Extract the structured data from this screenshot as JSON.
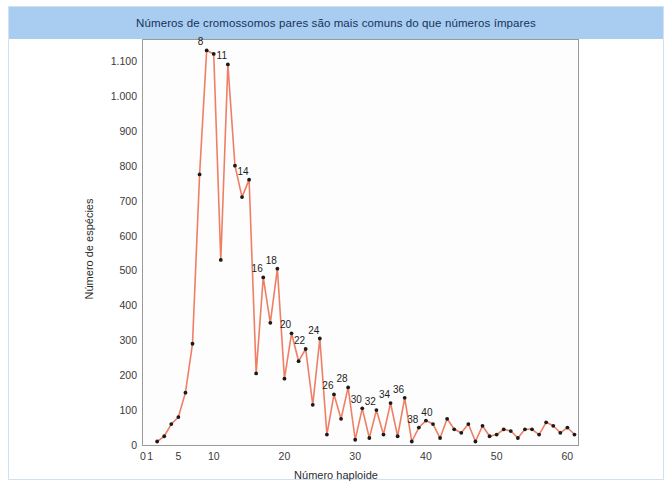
{
  "figure": {
    "title": "Números de cromossomos pares são mais comuns do que números ímpares",
    "title_bar_color": "#a8cdf0",
    "border_color": "#cfe2f3",
    "plot_background": "#fdfdfd",
    "plot_border_color": "#9a9a9a"
  },
  "chart_data": {
    "type": "line",
    "title": "Números de cromossomos pares são mais comuns do que números ímpares",
    "xlabel": "Número haploide",
    "ylabel": "Número de espécies",
    "xlim": [
      0,
      61.5
    ],
    "ylim": [
      0,
      1160
    ],
    "grid": false,
    "legend": null,
    "line_color": "#ef7f64",
    "marker_color": "#1a1a1a",
    "y_ticks": [
      0,
      100,
      200,
      300,
      400,
      500,
      600,
      700,
      800,
      900,
      1000,
      1100
    ],
    "y_tick_labels": [
      "0",
      "100",
      "200",
      "300",
      "400",
      "500",
      "600",
      "700",
      "800",
      "900",
      "1.000",
      "1.100"
    ],
    "x_ticks": [
      0,
      1,
      5,
      10,
      20,
      30,
      40,
      50,
      60
    ],
    "x_tick_labels": [
      "0",
      "1",
      "5",
      "10",
      "20",
      "30",
      "40",
      "50",
      "60"
    ],
    "x": [
      2,
      3,
      4,
      5,
      6,
      7,
      8,
      9,
      10,
      11,
      12,
      13,
      14,
      15,
      16,
      17,
      18,
      19,
      20,
      21,
      22,
      23,
      24,
      25,
      26,
      27,
      28,
      29,
      30,
      31,
      32,
      33,
      34,
      35,
      36,
      37,
      38,
      39,
      40,
      41,
      42,
      43,
      44,
      45,
      46,
      47,
      48,
      49,
      50,
      51,
      52,
      53,
      54,
      55,
      56,
      57,
      58,
      59,
      60,
      61
    ],
    "values": [
      10,
      25,
      60,
      80,
      150,
      290,
      775,
      1130,
      1120,
      530,
      1090,
      800,
      710,
      760,
      205,
      480,
      350,
      505,
      190,
      320,
      240,
      275,
      115,
      305,
      30,
      145,
      75,
      165,
      15,
      105,
      20,
      100,
      30,
      120,
      25,
      135,
      10,
      50,
      70,
      60,
      20,
      75,
      45,
      35,
      60,
      10,
      55,
      25,
      30,
      45,
      40,
      20,
      45,
      45,
      30,
      65,
      55,
      35,
      50,
      30
    ],
    "point_labels": [
      {
        "x": 8,
        "value": 1130,
        "text": "8"
      },
      {
        "x": 11,
        "value": 1090,
        "text": "11"
      },
      {
        "x": 14,
        "value": 760,
        "text": "14"
      },
      {
        "x": 16,
        "value": 480,
        "text": "16"
      },
      {
        "x": 18,
        "value": 505,
        "text": "18"
      },
      {
        "x": 20,
        "value": 320,
        "text": "20"
      },
      {
        "x": 22,
        "value": 275,
        "text": "22"
      },
      {
        "x": 24,
        "value": 305,
        "text": "24"
      },
      {
        "x": 26,
        "value": 145,
        "text": "26"
      },
      {
        "x": 28,
        "value": 165,
        "text": "28"
      },
      {
        "x": 30,
        "value": 105,
        "text": "30"
      },
      {
        "x": 32,
        "value": 100,
        "text": "32"
      },
      {
        "x": 34,
        "value": 120,
        "text": "34"
      },
      {
        "x": 36,
        "value": 135,
        "text": "36"
      },
      {
        "x": 38,
        "value": 50,
        "text": "38"
      },
      {
        "x": 40,
        "value": 70,
        "text": "40"
      }
    ]
  }
}
